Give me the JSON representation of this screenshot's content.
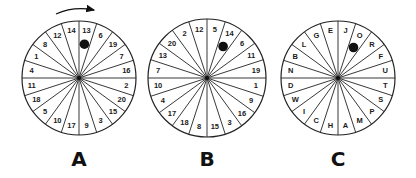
{
  "figure": {
    "rotation_arrow": {
      "wheel": "A",
      "direction": "clockwise"
    },
    "wheels": [
      {
        "label": "A",
        "cx": 79,
        "cy": 78,
        "r": 57,
        "segments": [
          "13",
          "6",
          "19",
          "7",
          "16",
          "2",
          "20",
          "15",
          "3",
          "9",
          "17",
          "10",
          "5",
          "18",
          "11",
          "4",
          "1",
          "8",
          "12",
          "14"
        ],
        "marker_segment_index": 0
      },
      {
        "label": "B",
        "cx": 207,
        "cy": 78,
        "r": 59,
        "segments": [
          "5",
          "14",
          "6",
          "11",
          "19",
          "1",
          "9",
          "16",
          "3",
          "15",
          "8",
          "18",
          "17",
          "4",
          "10",
          "7",
          "13",
          "20",
          "2",
          "12"
        ],
        "marker_segment_index": 1
      },
      {
        "label": "C",
        "cx": 338,
        "cy": 78,
        "r": 57,
        "segments": [
          "J",
          "O",
          "R",
          "F",
          "U",
          "T",
          "S",
          "P",
          "M",
          "A",
          "H",
          "C",
          "I",
          "W",
          "D",
          "N",
          "B",
          "L",
          "G",
          "E"
        ],
        "marker_segment_index": 1
      }
    ],
    "marker_color": "#111111",
    "line_color": "#222222"
  }
}
